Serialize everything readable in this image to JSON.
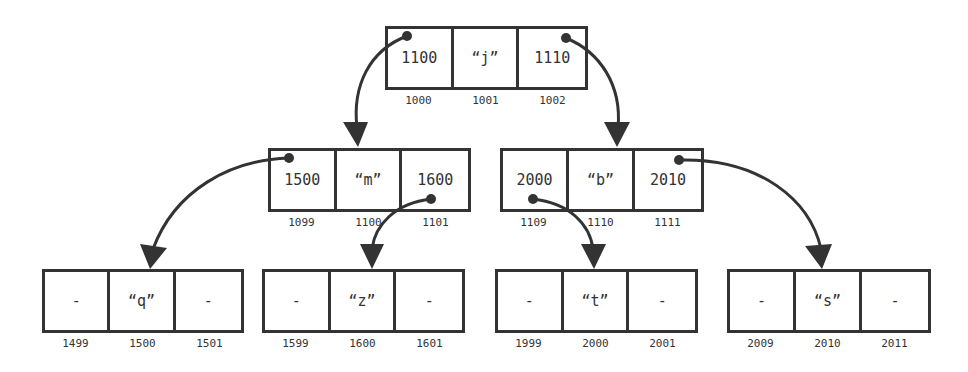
{
  "diagram": {
    "title": "",
    "colors": {
      "stroke": "#333333",
      "background": "#ffffff"
    },
    "nodes": [
      {
        "id": "root",
        "cells": [
          "1100",
          "“j”",
          "1110"
        ],
        "addresses": [
          "1000",
          "1001",
          "1002"
        ]
      },
      {
        "id": "mid-left",
        "cells": [
          "1500",
          "“m”",
          "1600"
        ],
        "addresses": [
          "1099",
          "1100",
          "1101"
        ]
      },
      {
        "id": "mid-right",
        "cells": [
          "2000",
          "“b”",
          "2010"
        ],
        "addresses": [
          "1109",
          "1110",
          "1111"
        ]
      },
      {
        "id": "leaf-q",
        "cells": [
          "-",
          "“q”",
          "-"
        ],
        "addresses": [
          "1499",
          "1500",
          "1501"
        ]
      },
      {
        "id": "leaf-z",
        "cells": [
          "-",
          "“z”",
          "-"
        ],
        "addresses": [
          "1599",
          "1600",
          "1601"
        ]
      },
      {
        "id": "leaf-t",
        "cells": [
          "-",
          "“t”",
          "-"
        ],
        "addresses": [
          "1999",
          "2000",
          "2001"
        ]
      },
      {
        "id": "leaf-s",
        "cells": [
          "-",
          "“s”",
          "-"
        ],
        "addresses": [
          "2009",
          "2010",
          "2011"
        ]
      }
    ],
    "edges": [
      {
        "from": "root.left (1100)",
        "to": "mid-left @1100"
      },
      {
        "from": "root.right (1110)",
        "to": "mid-right @1110"
      },
      {
        "from": "mid-left.left (1500)",
        "to": "leaf-q @1500"
      },
      {
        "from": "mid-left.right (1600)",
        "to": "leaf-z @1600"
      },
      {
        "from": "mid-right.left (2000)",
        "to": "leaf-t @2000"
      },
      {
        "from": "mid-right.right (2010)",
        "to": "leaf-s @2010"
      }
    ]
  }
}
